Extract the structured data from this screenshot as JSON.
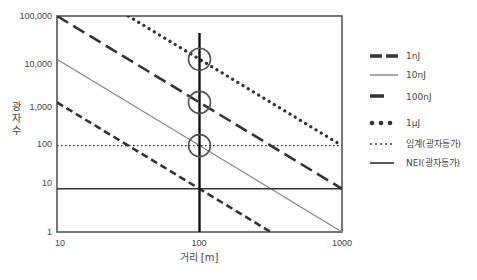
{
  "chart_data": {
    "type": "line",
    "title": "",
    "xlabel": "거리 [m]",
    "ylabel": "광자수",
    "xscale": "log",
    "yscale": "log",
    "xlim": [
      10,
      1000
    ],
    "ylim": [
      1,
      100000
    ],
    "x_ticks": [
      "10",
      "100",
      "1000"
    ],
    "y_ticks": [
      "1",
      "10",
      "100",
      "1,000",
      "10,000",
      "100,000"
    ],
    "grid": false,
    "legend_position": "right",
    "series": [
      {
        "name": "1nJ",
        "style": "dashed-short",
        "color": "#333333",
        "x": [
          10,
          100,
          316
        ],
        "y": [
          1000,
          10,
          1
        ]
      },
      {
        "name": "10nJ",
        "style": "solid-thin-gray",
        "color": "#888888",
        "x": [
          10,
          100,
          1000
        ],
        "y": [
          10000,
          100,
          1
        ]
      },
      {
        "name": "100nJ",
        "style": "dashed-long",
        "color": "#333333",
        "x": [
          10,
          100,
          1000
        ],
        "y": [
          100000,
          1000,
          10
        ]
      },
      {
        "name": "1μJ",
        "style": "dotted-heavy",
        "color": "#333333",
        "x": [
          31.6,
          100,
          1000
        ],
        "y": [
          100000,
          10000,
          100
        ]
      },
      {
        "name": "임계(광자등가)",
        "style": "dotted-thin",
        "color": "#333333",
        "x": [
          10,
          1000
        ],
        "y": [
          100,
          100
        ]
      },
      {
        "name": "NEI(광자등가)",
        "style": "solid",
        "color": "#333333",
        "x": [
          10,
          1000
        ],
        "y": [
          10,
          10
        ]
      }
    ],
    "annotations": [
      {
        "type": "vline",
        "x": 100
      },
      {
        "type": "circle",
        "x": 100,
        "y": 10000
      },
      {
        "type": "circle",
        "x": 100,
        "y": 1000
      },
      {
        "type": "circle",
        "x": 100,
        "y": 100
      }
    ]
  },
  "axis": {
    "xlabel": "거리 [m]",
    "ylabel_chars": [
      "광",
      "자",
      "수"
    ],
    "x_ticks": [
      "10",
      "100",
      "1000"
    ],
    "y_ticks": [
      "1",
      "10",
      "100",
      "1,000",
      "10,000",
      "100,000"
    ]
  },
  "legend": [
    {
      "label": "1nJ"
    },
    {
      "label": "10nJ"
    },
    {
      "label": "100nJ"
    },
    {
      "label": "1μJ"
    },
    {
      "label": "임계(광자등가)"
    },
    {
      "label": "NEI(광자등가)"
    }
  ]
}
